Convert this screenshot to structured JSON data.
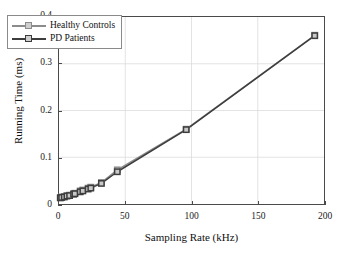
{
  "chart_data": {
    "type": "line",
    "title": "",
    "xlabel": "Sampling Rate (kHz)",
    "ylabel": "Running Time (ms)",
    "xlim": [
      0,
      200
    ],
    "ylim": [
      0,
      0.4
    ],
    "xticks": [
      0,
      50,
      100,
      150,
      200
    ],
    "yticks": [
      0,
      0.1,
      0.2,
      0.3,
      0.4
    ],
    "xtick_labels": [
      "0",
      "50",
      "100",
      "150",
      "200"
    ],
    "ytick_labels": [
      "0",
      "0.1",
      "0.2",
      "0.3",
      "0.4"
    ],
    "grid": true,
    "legend_position": "upper left",
    "marker": "square",
    "series": [
      {
        "name": "Healthy Controls",
        "color": "#8c8c8c",
        "x": [
          1,
          2,
          4,
          6,
          8,
          11,
          12,
          16,
          18,
          22,
          24,
          32,
          44,
          96,
          193
        ],
        "y": [
          0.014,
          0.015,
          0.016,
          0.018,
          0.019,
          0.022,
          0.023,
          0.028,
          0.03,
          0.034,
          0.036,
          0.046,
          0.073,
          0.16,
          0.361
        ]
      },
      {
        "name": "PD Patients",
        "color": "#3d3d3d",
        "x": [
          1,
          2,
          4,
          6,
          8,
          11,
          12,
          16,
          18,
          22,
          24,
          32,
          44,
          96,
          193
        ],
        "y": [
          0.013,
          0.014,
          0.015,
          0.017,
          0.018,
          0.021,
          0.022,
          0.026,
          0.028,
          0.032,
          0.034,
          0.044,
          0.069,
          0.159,
          0.36
        ]
      }
    ]
  },
  "legend": {
    "items": [
      {
        "label": "Healthy Controls"
      },
      {
        "label": "PD Patients"
      }
    ]
  }
}
